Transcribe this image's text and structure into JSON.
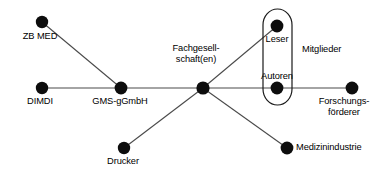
{
  "diagram": {
    "type": "node-link-diagram",
    "width": 383,
    "height": 176,
    "background_color": "#ffffff",
    "node_color": "#0d0d0d",
    "edge_color": "#4a4a4a",
    "outline_color": "#1a1a1a",
    "nodes": [
      {
        "id": "zb_med",
        "label": "ZB MED",
        "x": 42,
        "y": 22,
        "r": 6.2,
        "label_x": 40,
        "label_y": 31,
        "align": "center",
        "lines": [
          "ZB MED"
        ]
      },
      {
        "id": "dimdi",
        "label": "DIMDI",
        "x": 42,
        "y": 88,
        "r": 6.2,
        "label_x": 40,
        "label_y": 96,
        "align": "center",
        "lines": [
          "DIMDI"
        ]
      },
      {
        "id": "gms_ggmbh",
        "label": "GMS-gGmbH",
        "x": 121,
        "y": 88,
        "r": 6.4,
        "label_x": 120,
        "label_y": 96,
        "align": "center",
        "lines": [
          "GMS-gGmbH"
        ]
      },
      {
        "id": "fachgesellschaften",
        "label": "Fachgesellschaft(en)",
        "x": 203,
        "y": 88,
        "r": 6.6,
        "label_x": 196,
        "label_y": 43,
        "align": "center",
        "lines": [
          "Fachgesell-",
          "schaft(en)"
        ]
      },
      {
        "id": "drucker",
        "label": "Drucker",
        "x": 124,
        "y": 148,
        "r": 6.2,
        "label_x": 123,
        "label_y": 156,
        "align": "center",
        "lines": [
          "Drucker"
        ]
      },
      {
        "id": "leser",
        "label": "Leser",
        "x": 277,
        "y": 26,
        "r": 6.4,
        "label_x": 277,
        "label_y": 34,
        "align": "center",
        "lines": [
          "Leser"
        ]
      },
      {
        "id": "autoren",
        "label": "Autoren",
        "x": 277,
        "y": 88,
        "r": 6.4,
        "label_x": 277,
        "label_y": 71,
        "align": "center",
        "lines": [
          "Autoren"
        ]
      },
      {
        "id": "forschungsfoerderer",
        "label": "Forschungsförderer",
        "x": 352,
        "y": 88,
        "r": 6.4,
        "label_x": 344,
        "label_y": 96,
        "align": "center",
        "lines": [
          "Forschungs-",
          "förderer"
        ]
      },
      {
        "id": "medizinindustrie",
        "label": "Medizinindustrie",
        "x": 287,
        "y": 148,
        "r": 6.4,
        "label_x": 296,
        "label_y": 142,
        "align": "left",
        "lines": [
          "Medizinindustrie"
        ]
      }
    ],
    "edges": [
      {
        "from": "zb_med",
        "to": "gms_ggmbh"
      },
      {
        "from": "dimdi",
        "to": "forschungsfoerderer"
      },
      {
        "from": "drucker",
        "to": "fachgesellschaften"
      },
      {
        "from": "fachgesellschaften",
        "to": "leser"
      }
    ],
    "groups": [
      {
        "id": "mitglieder",
        "label": "Mitglieder",
        "members": [
          "leser",
          "autoren"
        ],
        "shape": "capsule",
        "x": 263,
        "y": 9,
        "width": 29,
        "height": 96,
        "label_x": 302,
        "label_y": 44
      }
    ]
  }
}
